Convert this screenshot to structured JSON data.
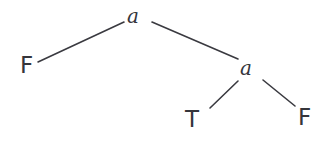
{
  "figure": {
    "kind": "binary-tree-diagram",
    "width": 326,
    "height": 143,
    "background_color": "#ffffff",
    "stroke_color": "#3a3a40",
    "text_color": "#35353b"
  },
  "nodes": {
    "root": {
      "label": "a",
      "role": "internal",
      "x": 136,
      "y": 16
    },
    "leaf_f1": {
      "label": "F",
      "role": "leaf",
      "x": 27,
      "y": 66
    },
    "inner_a2": {
      "label": "a",
      "role": "internal",
      "x": 248,
      "y": 68
    },
    "leaf_t": {
      "label": "T",
      "role": "leaf",
      "x": 193,
      "y": 120
    },
    "leaf_f2": {
      "label": "F",
      "role": "leaf",
      "x": 305,
      "y": 118
    }
  },
  "edges": [
    {
      "name": "root-to-left-f",
      "from": "root",
      "to": "leaf_f1",
      "x1": 124,
      "y1": 22,
      "x2": 38,
      "y2": 62
    },
    {
      "name": "root-to-right-a",
      "from": "root",
      "to": "inner_a2",
      "x1": 152,
      "y1": 22,
      "x2": 238,
      "y2": 59
    },
    {
      "name": "a2-to-t",
      "from": "inner_a2",
      "to": "leaf_t",
      "x1": 238,
      "y1": 81,
      "x2": 210,
      "y2": 108
    },
    {
      "name": "a2-to-f",
      "from": "inner_a2",
      "to": "leaf_f2",
      "x1": 263,
      "y1": 80,
      "x2": 295,
      "y2": 106
    }
  ]
}
